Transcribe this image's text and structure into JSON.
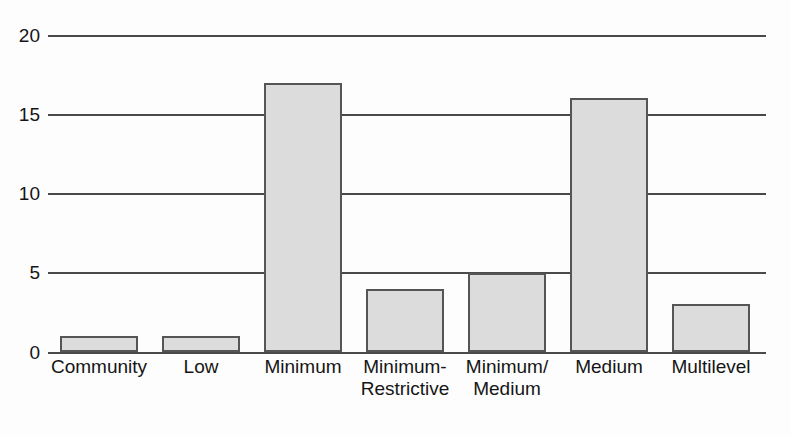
{
  "chart_data": {
    "type": "bar",
    "title": "",
    "subtitle": "",
    "xlabel": "",
    "ylabel": "",
    "categories": [
      "Community",
      "Minimum-\nRestrictive",
      "Minimum/\nMedium",
      "Medium",
      "Multilevel",
      "Low",
      "Minimum"
    ],
    "category_lines": [
      [
        "Community",
        ""
      ],
      [
        "Low",
        ""
      ],
      [
        "Minimum",
        ""
      ],
      [
        "Minimum-",
        "Restrictive"
      ],
      [
        "Minimum/",
        "Medium"
      ],
      [
        "Medium",
        ""
      ],
      [
        "Multilevel",
        ""
      ]
    ],
    "values": [
      1,
      1,
      17,
      4,
      5,
      16,
      3
    ],
    "ylim": [
      0,
      20
    ],
    "yticks": [
      0,
      5,
      10,
      15,
      20
    ],
    "ytick_labels": [
      "0",
      "5",
      "10",
      "15",
      "20"
    ],
    "grid": true,
    "grid_axis": "y",
    "legend": null,
    "legend_position": "none",
    "bar_fill_color": "#dcdcdc",
    "bar_border_color": "#555555",
    "grid_color": "#4a4a4a",
    "background_color": "#fdfdfd",
    "text_color": "#151515"
  }
}
